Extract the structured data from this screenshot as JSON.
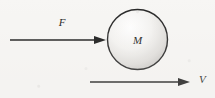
{
  "figure": {
    "type": "physics-free-body-diagram",
    "background_color": "#f7f6f4",
    "stroke_color": "#1a1a1a",
    "body": {
      "shape": "circle",
      "label": "M",
      "center_x": 137.5,
      "center_y": 39.5,
      "radius": 30.5,
      "fill_light": "#fbfbfb",
      "fill_shadow": "#c9c7c4",
      "outline_color": "#262626",
      "outline_width": 1.4
    },
    "arrows": [
      {
        "name": "force-arrow",
        "label": "F",
        "label_x": 62,
        "label_y": 26,
        "x1": 10,
        "y1": 40,
        "x2": 106,
        "y2": 40,
        "direction": "right",
        "line_width": 1.6,
        "head_length": 11,
        "head_width": 8
      },
      {
        "name": "velocity-arrow",
        "label": "V",
        "label_x": 199,
        "label_y": 83,
        "x1": 90,
        "y1": 82,
        "x2": 190,
        "y2": 82,
        "direction": "right",
        "line_width": 1.6,
        "head_length": 11,
        "head_width": 8
      }
    ]
  }
}
